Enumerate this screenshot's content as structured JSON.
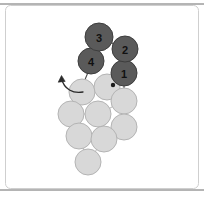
{
  "figure": {
    "title": "",
    "background_color": "#ffffff",
    "frame": {
      "top_line_y": 4,
      "bottom_line_y": 190,
      "left_line_x": 5,
      "right_line_x": 199,
      "line_color": "#6b6b6b",
      "inner_border_color": "#c9c9c9"
    }
  },
  "palette": {
    "selected_fill": "#5a5a5a",
    "selected_stroke": "#3d3d3d",
    "unselected_fill": "#d8d8d8",
    "unselected_stroke": "#b4b4b4",
    "link_color": "#4a4a4a",
    "arrow_color": "#2b2b2b",
    "label_color": "#111111"
  },
  "graph": {
    "selected_nodes": [
      {
        "id": "n1",
        "label": "1",
        "cx": 124,
        "cy": 73,
        "r": 13
      },
      {
        "id": "n2",
        "label": "2",
        "cx": 125,
        "cy": 49,
        "r": 13
      },
      {
        "id": "n3",
        "label": "3",
        "cx": 99,
        "cy": 37,
        "r": 14
      },
      {
        "id": "n4",
        "label": "4",
        "cx": 91,
        "cy": 61,
        "r": 13
      }
    ],
    "unselected_nodes": [
      {
        "id": "u1",
        "cx": 82,
        "cy": 92,
        "r": 13
      },
      {
        "id": "u2",
        "cx": 107,
        "cy": 87,
        "r": 13
      },
      {
        "id": "u3",
        "cx": 124,
        "cy": 101,
        "r": 13
      },
      {
        "id": "u4",
        "cx": 71,
        "cy": 114,
        "r": 13
      },
      {
        "id": "u5",
        "cx": 98,
        "cy": 114,
        "r": 13
      },
      {
        "id": "u6",
        "cx": 124,
        "cy": 127,
        "r": 13
      },
      {
        "id": "u7",
        "cx": 79,
        "cy": 136,
        "r": 13
      },
      {
        "id": "u8",
        "cx": 104,
        "cy": 139,
        "r": 13
      },
      {
        "id": "u9",
        "cx": 88,
        "cy": 162,
        "r": 13
      }
    ],
    "edges": [
      {
        "from": "n3",
        "to": "n2"
      },
      {
        "from": "n3",
        "to": "n4"
      },
      {
        "from": "n2",
        "to": "n1"
      },
      {
        "from": "n4",
        "to": "u1"
      },
      {
        "from": "n1",
        "to": "u3"
      },
      {
        "from": "u1",
        "to": "u2"
      },
      {
        "from": "u2",
        "to": "u3"
      },
      {
        "from": "u1",
        "to": "u5"
      },
      {
        "from": "u4",
        "to": "u5"
      },
      {
        "from": "u5",
        "to": "u3"
      },
      {
        "from": "u3",
        "to": "u6"
      },
      {
        "from": "u4",
        "to": "u7"
      },
      {
        "from": "u7",
        "to": "u8"
      },
      {
        "from": "u8",
        "to": "u5"
      },
      {
        "from": "u8",
        "to": "u6"
      },
      {
        "from": "u7",
        "to": "u9"
      },
      {
        "from": "u9",
        "to": "u8"
      }
    ],
    "marker_dot": {
      "cx": 113,
      "cy": 85,
      "r": 2.2
    },
    "arrow": {
      "path": "M 83 92 C 73 93, 65 88, 62 78",
      "tip_x": 62,
      "tip_y": 76
    }
  }
}
